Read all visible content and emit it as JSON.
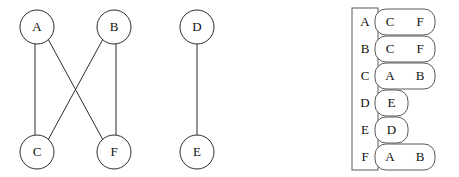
{
  "figure": {
    "title": "",
    "colors": {
      "stroke": "#2b2b2b",
      "box_stroke": "#5a5a5a",
      "fill": "#ffffff",
      "text": "#111111"
    }
  },
  "graph": {
    "nodes": [
      {
        "id": "A",
        "label": "A",
        "cx": 37,
        "cy": 27,
        "r": 17
      },
      {
        "id": "B",
        "label": "B",
        "cx": 114,
        "cy": 27,
        "r": 17
      },
      {
        "id": "D",
        "label": "D",
        "cx": 197,
        "cy": 27,
        "r": 17
      },
      {
        "id": "C",
        "label": "C",
        "cx": 37,
        "cy": 152,
        "r": 17
      },
      {
        "id": "F",
        "label": "F",
        "cx": 114,
        "cy": 152,
        "r": 17
      },
      {
        "id": "E",
        "label": "E",
        "cx": 197,
        "cy": 152,
        "r": 17
      }
    ],
    "edges": [
      {
        "from": "A",
        "to": "C",
        "x1": 35,
        "y1": 44,
        "x2": 35,
        "y2": 135
      },
      {
        "from": "A",
        "to": "F",
        "x1": 48,
        "y1": 39,
        "x2": 103,
        "y2": 140
      },
      {
        "from": "B",
        "to": "C",
        "x1": 103,
        "y1": 39,
        "x2": 48,
        "y2": 140
      },
      {
        "from": "B",
        "to": "F",
        "x1": 116,
        "y1": 44,
        "x2": 116,
        "y2": 135
      },
      {
        "from": "D",
        "to": "E",
        "x1": 197,
        "y1": 44,
        "x2": 197,
        "y2": 135
      }
    ]
  },
  "adjacency_list": {
    "index_column": {
      "x": 352,
      "y": 8,
      "width": 26,
      "height": 162,
      "labels": [
        "A",
        "B",
        "C",
        "D",
        "E",
        "F"
      ]
    },
    "rows": [
      {
        "vertex": "A",
        "neighbors": [
          "C",
          "F"
        ],
        "box_x": 375,
        "box_y": 9,
        "box_w": 60,
        "box_h": 26
      },
      {
        "vertex": "B",
        "neighbors": [
          "C",
          "F"
        ],
        "box_x": 375,
        "box_y": 36,
        "box_w": 60,
        "box_h": 26
      },
      {
        "vertex": "C",
        "neighbors": [
          "A",
          "B"
        ],
        "box_x": 375,
        "box_y": 63,
        "box_w": 60,
        "box_h": 26
      },
      {
        "vertex": "D",
        "neighbors": [
          "E"
        ],
        "box_x": 375,
        "box_y": 90,
        "box_w": 33,
        "box_h": 26
      },
      {
        "vertex": "E",
        "neighbors": [
          "D"
        ],
        "box_x": 375,
        "box_y": 117,
        "box_w": 33,
        "box_h": 26
      },
      {
        "vertex": "F",
        "neighbors": [
          "A",
          "B"
        ],
        "box_x": 375,
        "box_y": 144,
        "box_w": 60,
        "box_h": 26
      }
    ]
  }
}
